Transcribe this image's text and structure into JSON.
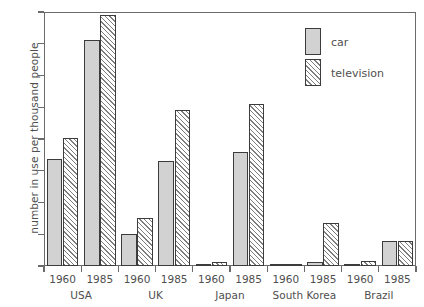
{
  "chart_data": {
    "type": "bar",
    "title": "",
    "xlabel": "",
    "ylabel": "number in use per thousand people",
    "ylim": [
      0,
      800
    ],
    "yticks": [
      0,
      100,
      200,
      300,
      400,
      500,
      600,
      700,
      800
    ],
    "grid": false,
    "legend_position": "top-right",
    "groups": [
      "USA",
      "UK",
      "Japan",
      "South Korea",
      "Brazil"
    ],
    "years": [
      "1960",
      "1985"
    ],
    "categories": [
      "USA 1960",
      "USA 1985",
      "UK 1960",
      "UK 1985",
      "Japan 1960",
      "Japan 1985",
      "South Korea 1960",
      "South Korea 1985",
      "Brazil 1960",
      "Brazil 1985"
    ],
    "series": [
      {
        "name": "car",
        "color": "#d2d2d2",
        "values": [
          337,
          712,
          101,
          331,
          3,
          359,
          1,
          13,
          4,
          79
        ]
      },
      {
        "name": "television",
        "color": "#7d7d7d",
        "values": [
          403,
          790,
          151,
          491,
          12,
          510,
          5,
          135,
          16,
          79
        ]
      }
    ]
  },
  "axis": {
    "y_title": "number in use per thousand people",
    "y_tick_labels": [
      "0",
      "100",
      "200",
      "300",
      "400",
      "500",
      "600",
      "700",
      "800"
    ],
    "year_labels": [
      "1960",
      "1985",
      "1960",
      "1985",
      "1960",
      "1985",
      "1960",
      "1985",
      "1960",
      "1985"
    ],
    "group_labels": [
      "USA",
      "UK",
      "Japan",
      "South Korea",
      "Brazil"
    ]
  },
  "legend": {
    "items": [
      {
        "label": "car",
        "swatch": "solid-light-gray"
      },
      {
        "label": "television",
        "swatch": "diagonal-hatch"
      }
    ]
  },
  "header": {
    "cropped_title": ""
  }
}
